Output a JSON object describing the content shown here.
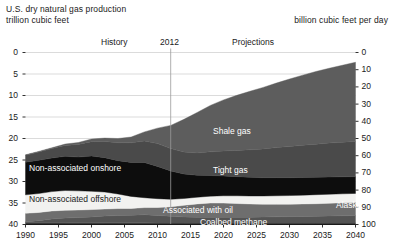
{
  "header": {
    "title_line1": "U.S. dry natural gas production",
    "title_line2": "trillion cubic feet",
    "right_unit": "billion cubic feet per day"
  },
  "annotations": {
    "history": "History",
    "divider_year": "2012",
    "projections": "Projections"
  },
  "chart_data": {
    "type": "area",
    "title": "U.S. dry natural gas production",
    "subtitle": "trillion cubic feet",
    "ylabel": "trillion cubic feet",
    "ylabel_right": "billion cubic feet per day",
    "xlabel": "",
    "grid": true,
    "legend_position": "inline-labels",
    "xlim": [
      1990,
      2040
    ],
    "ylim": [
      0,
      40
    ],
    "ylim_right": [
      0,
      100
    ],
    "xticks": [
      1990,
      1995,
      2000,
      2005,
      2010,
      2015,
      2020,
      2025,
      2030,
      2035,
      2040
    ],
    "yticks_left": [
      0,
      5,
      10,
      15,
      20,
      25,
      30,
      35,
      40
    ],
    "yticks_right": [
      0,
      10,
      20,
      30,
      40,
      50,
      60,
      70,
      80,
      90,
      100
    ],
    "divider_year": 2012,
    "x": [
      1990,
      1992,
      1994,
      1996,
      1998,
      2000,
      2002,
      2004,
      2006,
      2008,
      2010,
      2012,
      2014,
      2016,
      2018,
      2020,
      2022,
      2024,
      2026,
      2028,
      2030,
      2032,
      2034,
      2036,
      2038,
      2040
    ],
    "stack_order_bottom_to_top": [
      "Alaska",
      "Coalbed methane",
      "Associated with oil",
      "Non-associated offshore",
      "Non-associated onshore",
      "Tight gas",
      "Shale gas"
    ],
    "series": [
      {
        "name": "Alaska",
        "color": "#3a3a3a",
        "values": [
          0.45,
          0.45,
          0.45,
          0.45,
          0.42,
          0.42,
          0.4,
          0.4,
          0.39,
          0.38,
          0.36,
          0.35,
          0.35,
          0.34,
          0.34,
          0.33,
          0.33,
          0.33,
          0.33,
          0.33,
          0.33,
          0.33,
          0.33,
          0.33,
          0.33,
          0.33
        ]
      },
      {
        "name": "Coalbed methane",
        "color": "#545454",
        "values": [
          0.2,
          0.45,
          0.85,
          1.05,
          1.2,
          1.35,
          1.55,
          1.7,
          1.75,
          1.9,
          1.75,
          1.55,
          1.4,
          1.35,
          1.35,
          1.35,
          1.35,
          1.35,
          1.4,
          1.45,
          1.5,
          1.55,
          1.6,
          1.65,
          1.7,
          1.75
        ]
      },
      {
        "name": "Associated with oil",
        "color": "#6e6e6e",
        "values": [
          1.95,
          1.9,
          1.85,
          1.8,
          1.75,
          1.7,
          1.65,
          1.6,
          1.6,
          1.65,
          1.85,
          2.2,
          2.7,
          3.1,
          3.3,
          3.3,
          3.2,
          3.1,
          3.0,
          2.95,
          2.9,
          2.9,
          2.9,
          2.95,
          3.0,
          3.05
        ]
      },
      {
        "name": "Non-associated offshore",
        "color": "#f2f2f0",
        "values": [
          4.3,
          4.4,
          4.5,
          4.6,
          4.45,
          4.25,
          3.95,
          3.4,
          2.8,
          2.3,
          2.05,
          1.75,
          1.6,
          1.55,
          1.6,
          1.7,
          1.8,
          1.85,
          1.9,
          1.95,
          2.0,
          2.05,
          2.1,
          2.1,
          2.1,
          2.1
        ]
      },
      {
        "name": "Non-associated onshore",
        "color": "#0d0d0d",
        "values": [
          7.6,
          7.75,
          7.8,
          7.95,
          7.85,
          8.2,
          8.0,
          7.75,
          7.9,
          8.2,
          7.5,
          6.6,
          5.7,
          5.1,
          4.8,
          4.6,
          4.45,
          4.35,
          4.25,
          4.2,
          4.15,
          4.1,
          4.05,
          4.0,
          3.95,
          3.9
        ]
      },
      {
        "name": "Tight gas",
        "color": "#4a4a4a",
        "values": [
          1.6,
          1.9,
          2.2,
          2.55,
          2.95,
          3.35,
          3.75,
          4.15,
          4.55,
          5.0,
          5.3,
          5.2,
          5.1,
          5.2,
          5.5,
          5.8,
          6.1,
          6.4,
          6.7,
          7.0,
          7.25,
          7.5,
          7.7,
          7.9,
          8.05,
          8.2
        ]
      },
      {
        "name": "Shale gas",
        "color": "#5d5d5d",
        "values": [
          0.1,
          0.15,
          0.2,
          0.3,
          0.45,
          0.6,
          0.8,
          1.0,
          1.35,
          2.1,
          3.6,
          5.4,
          7.6,
          9.4,
          10.8,
          11.9,
          12.8,
          13.6,
          14.3,
          15.0,
          15.7,
          16.3,
          16.9,
          17.4,
          17.9,
          18.4
        ]
      }
    ],
    "totals": [
      16.2,
      16.9,
      17.85,
      18.7,
      19.07,
      19.87,
      20.1,
      19.9,
      20.34,
      21.53,
      22.41,
      23.05,
      24.45,
      26.04,
      27.69,
      28.98,
      30.03,
      31.28,
      31.88,
      32.88,
      33.73,
      34.73,
      35.58,
      36.33,
      37.03,
      37.73
    ]
  },
  "series_labels": {
    "shale": "Shale gas",
    "tight": "Tight gas",
    "nonassoc_onshore": "Non-associated onshore",
    "nonassoc_offshore": "Non-associated offshore",
    "associated": "Associated with oil",
    "coalbed": "Coalbed methane",
    "alaska": "Alaska"
  },
  "axis": {
    "left_ticks": [
      "40",
      "35",
      "30",
      "25",
      "20",
      "15",
      "10",
      "5",
      "0"
    ],
    "right_ticks": [
      "100",
      "90",
      "80",
      "70",
      "60",
      "50",
      "40",
      "30",
      "20",
      "10",
      "0"
    ],
    "x_ticks": [
      "1990",
      "1995",
      "2000",
      "2005",
      "2010",
      "2015",
      "2020",
      "2025",
      "2030",
      "2035",
      "2040"
    ]
  },
  "colors": {
    "background": "#ffffff",
    "grid": "#d2d2d2",
    "axis": "#1a1a1a",
    "divider": "#9a9a9a"
  }
}
